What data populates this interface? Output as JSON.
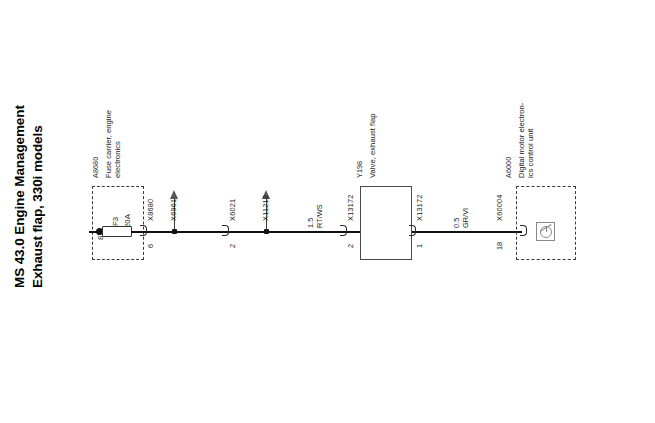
{
  "title": {
    "line1": "MS 43.0 Engine Management",
    "line2": "Exhaust flap, 330i models"
  },
  "components": {
    "fuse_carrier": {
      "ref": "A8680",
      "description": "Fuse carrier, engine\nelectronics",
      "fuse_designation": "F3",
      "fuse_rating": "20A",
      "terminal": "87"
    },
    "valve": {
      "ref": "Y198",
      "description": "Valve, exhaust flap"
    },
    "control_unit": {
      "ref": "A6000",
      "description": "Digital motor electron-\nics control unit",
      "symbol": "ecu-module-icon"
    }
  },
  "connectors": [
    {
      "name": "X8680",
      "pin": "6"
    },
    {
      "name": "X6961",
      "pin": ""
    },
    {
      "name": "X6021",
      "pin": "2"
    },
    {
      "name": "X11212",
      "pin": ""
    },
    {
      "name": "X13172",
      "pin": "2"
    },
    {
      "name": "X13172",
      "pin": "1"
    },
    {
      "name": "X60004",
      "pin": "18"
    }
  ],
  "wires": [
    {
      "size": "1.5",
      "colour": "RT/WS"
    },
    {
      "size": "0.5",
      "colour": "GR/VI"
    }
  ],
  "colors": {
    "wire": "#111111",
    "box_outline": "#4a4a4a",
    "dashed_outline": "#3a3a3a",
    "arrow": "#555555",
    "text": "#1a1a1a"
  }
}
